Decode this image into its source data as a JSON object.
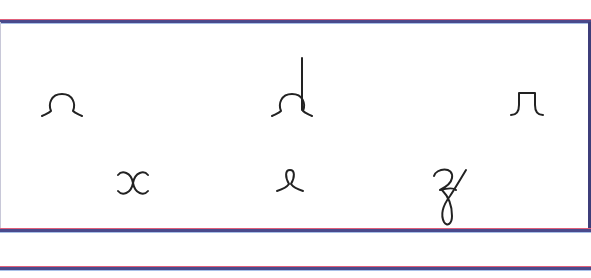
{
  "worksheet": {
    "colors": {
      "rule_red": "#e0607a",
      "rule_blue": "#4a4a8c",
      "ink": "#222222"
    },
    "row1": [
      {
        "label": "a",
        "icon": "cursive-a-fragment-icon"
      },
      {
        "label": "d",
        "icon": "cursive-d-fragment-icon"
      },
      {
        "label": "n",
        "icon": "cursive-n-fragment-icon"
      }
    ],
    "row2": [
      {
        "label": "x",
        "icon": "cursive-x-fragment-icon"
      },
      {
        "label": "e",
        "icon": "cursive-e-fragment-icon"
      },
      {
        "label": "z",
        "icon": "cursive-z-fragment-icon"
      }
    ]
  }
}
